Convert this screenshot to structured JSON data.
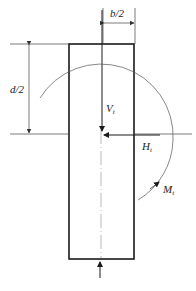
{
  "diagram": {
    "labels": {
      "half_width": "b/2",
      "half_depth": "d/2",
      "vertical_force": "V",
      "vertical_force_sub": "t",
      "horizontal_force": "H",
      "horizontal_force_sub": "t",
      "moment": "M",
      "moment_sub": "t"
    },
    "colors": {
      "stroke": "#1a1a1a",
      "thin_line": "#444444"
    }
  }
}
